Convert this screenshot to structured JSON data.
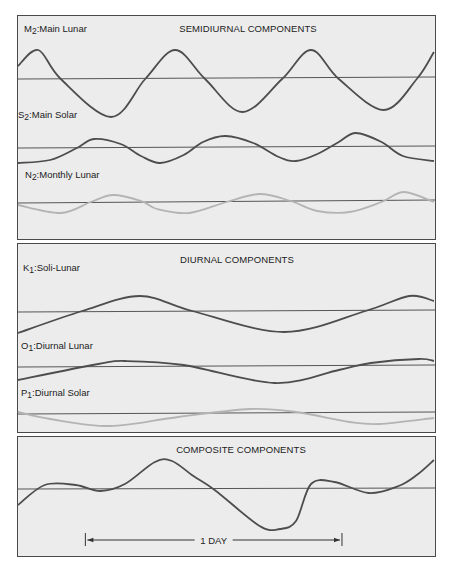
{
  "figure": {
    "time_unit": "hours",
    "day_length_hours": 24,
    "span_hours": 39,
    "colors": {
      "curve_dark": "#4d4d4d",
      "curve_light": "#b4b4b4",
      "panel": "#ececec",
      "baseline": "#555555"
    }
  },
  "panels": [
    {
      "id": "semidiurnal",
      "title": "SEMIDIURNAL COMPONENTS",
      "components": [
        {
          "symbol": "M",
          "subscript": "2",
          "name": ":Main Lunar",
          "style": "dark",
          "points": [
            [
              0,
              1.3
            ],
            [
              1.9,
              2.9
            ],
            [
              4.0,
              0
            ],
            [
              8.7,
              -3.8
            ],
            [
              11.9,
              0
            ],
            [
              14.7,
              2.9
            ],
            [
              17.5,
              0
            ],
            [
              21.0,
              -3.3
            ],
            [
              24.7,
              0
            ],
            [
              27.4,
              2.9
            ],
            [
              30.0,
              0
            ],
            [
              34.2,
              -3.1
            ],
            [
              37.3,
              0
            ],
            [
              38.9,
              2.7
            ]
          ]
        },
        {
          "symbol": "S",
          "subscript": "2",
          "name": ":Main Solar",
          "style": "dark",
          "points": [
            [
              0,
              -1.5
            ],
            [
              3.0,
              -1.2
            ],
            [
              5.5,
              0
            ],
            [
              7.1,
              0.9
            ],
            [
              9.6,
              0.4
            ],
            [
              11.5,
              -0.8
            ],
            [
              13.3,
              -1.5
            ],
            [
              15.5,
              -0.7
            ],
            [
              17.3,
              0.6
            ],
            [
              19.4,
              1.2
            ],
            [
              22.0,
              0.5
            ],
            [
              24.4,
              -0.9
            ],
            [
              26.0,
              -1.3
            ],
            [
              28.0,
              -0.6
            ],
            [
              30.0,
              0.6
            ],
            [
              31.6,
              1.5
            ],
            [
              34.0,
              0.6
            ],
            [
              36.0,
              -0.8
            ],
            [
              38.9,
              -1.3
            ]
          ]
        },
        {
          "symbol": "N",
          "subscript": "2",
          "name": ":Monthly Lunar",
          "style": "light",
          "points": [
            [
              0,
              -0.3
            ],
            [
              4.0,
              -1.1
            ],
            [
              6.8,
              0
            ],
            [
              8.9,
              0.7
            ],
            [
              11.5,
              0.1
            ],
            [
              13.0,
              -0.7
            ],
            [
              16.0,
              -1.1
            ],
            [
              19.5,
              0
            ],
            [
              22.6,
              0.8
            ],
            [
              25.5,
              0.1
            ],
            [
              28.0,
              -0.9
            ],
            [
              31.0,
              -1.0
            ],
            [
              34.0,
              0
            ],
            [
              36.1,
              1.0
            ],
            [
              38.9,
              0
            ]
          ]
        }
      ]
    },
    {
      "id": "diurnal",
      "title": "DIURNAL COMPONENTS",
      "components": [
        {
          "symbol": "K",
          "subscript": "1",
          "name": ":Soli-Lunar",
          "style": "dark",
          "points": [
            [
              0,
              -2.2
            ],
            [
              6.0,
              0
            ],
            [
              11.4,
              1.5
            ],
            [
              16.3,
              0
            ],
            [
              24.9,
              -2.1
            ],
            [
              32.5,
              0
            ],
            [
              36.6,
              1.5
            ],
            [
              38.9,
              1.0
            ]
          ]
        },
        {
          "symbol": "O",
          "subscript": "1",
          "name": ":Diurnal Lunar",
          "style": "dark",
          "points": [
            [
              0,
              -1.4
            ],
            [
              7.5,
              0.2
            ],
            [
              10.0,
              0.5
            ],
            [
              15.5,
              0.1
            ],
            [
              24.0,
              -1.7
            ],
            [
              30.0,
              -0.4
            ],
            [
              33.0,
              0.3
            ],
            [
              37.5,
              0.7
            ],
            [
              38.9,
              0.5
            ]
          ]
        },
        {
          "symbol": "P",
          "subscript": "1",
          "name": ":Diurnal Solar",
          "style": "light",
          "points": [
            [
              0,
              0.1
            ],
            [
              3.0,
              -0.6
            ],
            [
              8.6,
              -1.3
            ],
            [
              15.0,
              -0.4
            ],
            [
              21.7,
              0.4
            ],
            [
              26.0,
              0.1
            ],
            [
              31.0,
              -0.9
            ],
            [
              33.8,
              -1.1
            ],
            [
              38.9,
              -0.5
            ]
          ]
        }
      ]
    },
    {
      "id": "composite",
      "title": "COMPOSITE COMPONENTS",
      "components": [
        {
          "symbol": "",
          "subscript": "",
          "name": "",
          "style": "dark",
          "points": [
            [
              0,
              -1.6
            ],
            [
              2.5,
              0.4
            ],
            [
              5.4,
              0.4
            ],
            [
              7.7,
              -0.2
            ],
            [
              10.0,
              0.5
            ],
            [
              12.8,
              2.7
            ],
            [
              14.4,
              2.8
            ],
            [
              16.4,
              1.3
            ],
            [
              18.4,
              -0.1
            ],
            [
              22.6,
              -3.7
            ],
            [
              24.5,
              -4.0
            ],
            [
              26.0,
              -3.2
            ],
            [
              27.4,
              0.5
            ],
            [
              29.6,
              0.7
            ],
            [
              32.8,
              -0.4
            ],
            [
              35.6,
              0.3
            ],
            [
              37.3,
              1.4
            ],
            [
              38.9,
              2.9
            ]
          ]
        }
      ],
      "day_marker": {
        "label": "1 DAY",
        "start_hour": 6.3,
        "end_hour": 30.3
      }
    }
  ]
}
